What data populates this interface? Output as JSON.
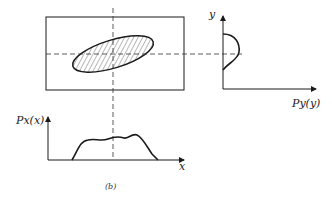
{
  "figure": {
    "caption": "(b)",
    "joint_plot": {
      "region": "hatched ellipse",
      "crosshair": "dashed"
    },
    "marginal_y": {
      "axis_label_y": "y",
      "axis_label_x": "Py(y)"
    },
    "marginal_x": {
      "axis_label_y": "Px(x)",
      "axis_label_x": "x"
    }
  },
  "colors": {
    "ink": "#1a1a1a",
    "background": "#ffffff"
  }
}
